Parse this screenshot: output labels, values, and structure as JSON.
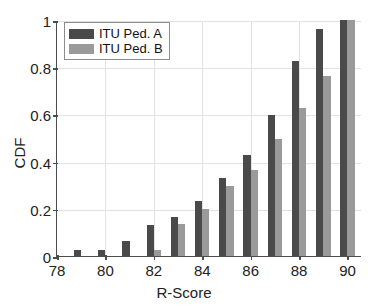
{
  "chart_data": {
    "type": "bar",
    "title": "",
    "xlabel": "R-Score",
    "ylabel": "CDF",
    "categories": [
      78,
      79,
      80,
      81,
      82,
      83,
      84,
      85,
      86,
      87,
      88,
      89,
      90
    ],
    "xlim": [
      78,
      90.6
    ],
    "ylim": [
      0,
      1
    ],
    "xticks": [
      "78",
      "80",
      "82",
      "84",
      "86",
      "88",
      "90"
    ],
    "xtick_values": [
      78,
      80,
      82,
      84,
      86,
      88,
      90
    ],
    "yticks": [
      "0",
      "0.2",
      "0.4",
      "0.6",
      "0.8",
      "1"
    ],
    "ytick_values": [
      0,
      0.2,
      0.4,
      0.6,
      0.8,
      1
    ],
    "grid": true,
    "legend_position": "upper left",
    "series": [
      {
        "name": "ITU Ped. A",
        "color": "#4a4a4a",
        "values": [
          0,
          0.027,
          0.025,
          0.062,
          0.133,
          0.166,
          0.232,
          0.331,
          0.428,
          0.596,
          0.828,
          0.962,
          0.998
        ]
      },
      {
        "name": "ITU Ped. B",
        "color": "#9a9a9a",
        "values": [
          0,
          0,
          0,
          0,
          0.027,
          0.134,
          0.201,
          0.298,
          0.365,
          0.496,
          0.628,
          0.763,
          0.998
        ]
      }
    ]
  }
}
